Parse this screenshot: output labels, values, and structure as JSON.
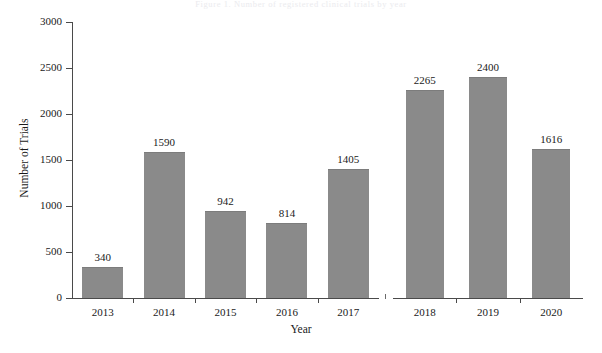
{
  "figure": {
    "top_caption": "Figure 1. Number of registered clinical trials by year",
    "background_color": "#ffffff",
    "bar_color": "#8a8a8a",
    "axis_color": "#4a4a4a",
    "text_color": "#1a1a1a"
  },
  "chart_data": {
    "type": "bar",
    "title": "",
    "xlabel": "Year",
    "ylabel": "Number of Trials",
    "categories": [
      "2013",
      "2014",
      "2015",
      "2016",
      "2017",
      "2018",
      "2019",
      "2020"
    ],
    "values": [
      340,
      1590,
      942,
      814,
      1405,
      2265,
      2400,
      1616
    ],
    "value_labels": [
      "340",
      "1590",
      "942",
      "814",
      "1405",
      "2265",
      "2400",
      "1616"
    ],
    "ylim": [
      0,
      3000
    ],
    "ytick_labels": [
      "0",
      "500",
      "1000",
      "1500",
      "2000",
      "2500",
      "3000"
    ],
    "ytick_values": [
      0,
      500,
      1000,
      1500,
      2000,
      2500,
      3000
    ],
    "grid": false,
    "legend": null,
    "axis_break": {
      "present": true,
      "between": [
        "2017",
        "2018"
      ]
    }
  }
}
